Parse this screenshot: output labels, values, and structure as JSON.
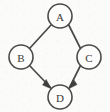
{
  "figure": {
    "type": "directed-acyclic-graph",
    "title": "",
    "background_color": "#fbfbfa",
    "stroke_color": "#4a4a4a",
    "label_color": "#3a3a3a",
    "arrow_color": "#3f3f3f",
    "width": 110,
    "height": 112
  },
  "nodes": [
    {
      "id": "A",
      "label": "A",
      "cx": 60,
      "cy": 16,
      "r": 12
    },
    {
      "id": "B",
      "label": "B",
      "cx": 21,
      "cy": 57,
      "r": 12
    },
    {
      "id": "C",
      "label": "C",
      "cx": 89,
      "cy": 57,
      "r": 12
    },
    {
      "id": "D",
      "label": "D",
      "cx": 60,
      "cy": 97,
      "r": 12
    }
  ],
  "edges": [
    {
      "id": "A-B",
      "from": "A",
      "to": "B",
      "directed": false,
      "x1": 51.5,
      "y1": 24.5,
      "x2": 29.5,
      "y2": 48.5
    },
    {
      "id": "A-C",
      "from": "A",
      "to": "C",
      "directed": false,
      "x1": 68.5,
      "y1": 24.5,
      "x2": 80.5,
      "y2": 48.5
    },
    {
      "id": "B-D",
      "from": "B",
      "to": "D",
      "directed": true,
      "x1": 29.5,
      "y1": 65.5,
      "x2": 51.5,
      "y2": 88.5
    },
    {
      "id": "C-D",
      "from": "C",
      "to": "D",
      "directed": true,
      "x1": 80.5,
      "y1": 65.5,
      "x2": 68.5,
      "y2": 88.5
    }
  ],
  "arrowheads": [
    {
      "id": "arrow-into-d-from-b",
      "points": "51.5,88.5 43.6,84.2 46.4,80.0"
    },
    {
      "id": "arrow-into-d-from-c",
      "points": "68.5,88.5 76.4,84.6 73.6,80.3"
    }
  ]
}
